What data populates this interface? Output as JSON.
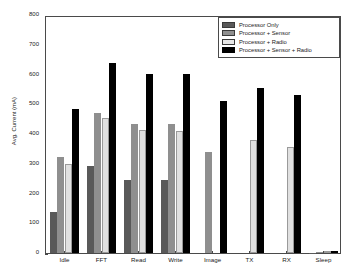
{
  "chart_data": {
    "type": "bar",
    "title": "",
    "xlabel": "",
    "ylabel": "Avg. Current (mA)",
    "ylim": [
      0,
      800
    ],
    "yticks": [
      0,
      100,
      200,
      300,
      400,
      500,
      600,
      700,
      800
    ],
    "grid": false,
    "legend_position": "top-right",
    "categories": [
      "Idle",
      "FFT",
      "Read",
      "Write",
      "Image",
      "TX",
      "RX",
      "Sleep"
    ],
    "series": [
      {
        "name": "Processor Only",
        "color": "#595959",
        "values": [
          138,
          291,
          247,
          247,
          null,
          null,
          null,
          1
        ]
      },
      {
        "name": "Processor + Sensor",
        "color": "#8f8f8f",
        "values": [
          324,
          472,
          432,
          433,
          338,
          null,
          null,
          3
        ]
      },
      {
        "name": "Processor + Radio",
        "color": "#e0e0e0",
        "values": [
          300,
          455,
          413,
          410,
          null,
          380,
          358,
          5
        ]
      },
      {
        "name": "Processor + Sensor + Radio",
        "color": "#000000",
        "values": [
          484,
          640,
          602,
          602,
          512,
          555,
          532,
          8
        ]
      }
    ]
  },
  "legend": {
    "entries": [
      "Processor Only",
      "Processor + Sensor",
      "Processor + Radio",
      "Processor + Sensor + Radio"
    ]
  }
}
